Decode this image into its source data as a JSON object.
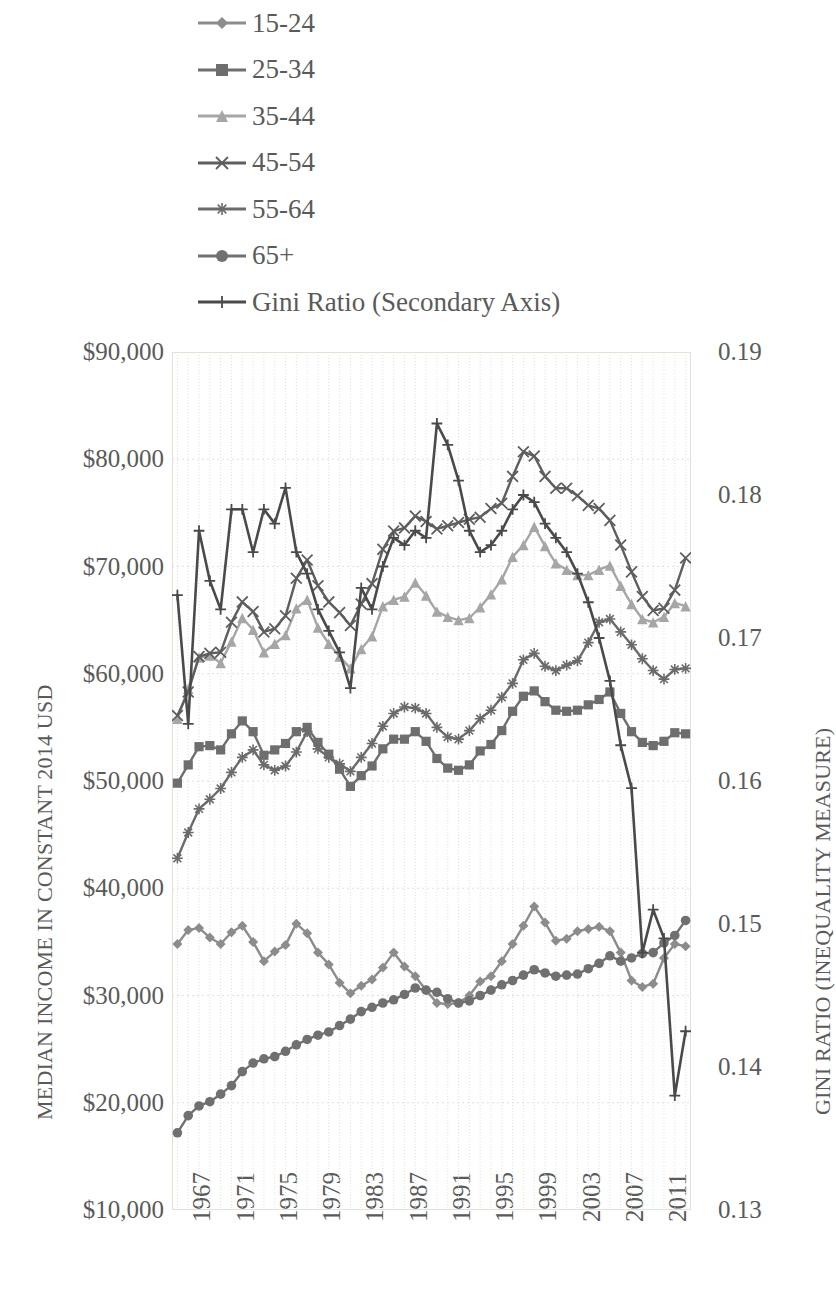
{
  "legend": {
    "position": "top",
    "items": [
      {
        "label": "15-24",
        "marker": "diamond-marker-icon",
        "color": "#8c8c8c"
      },
      {
        "label": "25-34",
        "marker": "square-marker-icon",
        "color": "#6e6e6e"
      },
      {
        "label": "35-44",
        "marker": "triangle-marker-icon",
        "color": "#a6a6a6"
      },
      {
        "label": "45-54",
        "marker": "x-marker-icon",
        "color": "#5e5e5e"
      },
      {
        "label": "55-64",
        "marker": "asterisk-marker-icon",
        "color": "#6b6b6b"
      },
      {
        "label": "65+",
        "marker": "circle-marker-icon",
        "color": "#707070"
      },
      {
        "label": "Gini Ratio (Secondary Axis)",
        "marker": "plus-marker-icon",
        "color": "#4a4a4a"
      }
    ]
  },
  "axes": {
    "y_left": {
      "title": "MEDIAN INCOME IN CONSTANT 2014 USD",
      "ticks": [
        "$90,000",
        "$80,000",
        "$70,000",
        "$60,000",
        "$50,000",
        "$40,000",
        "$30,000",
        "$20,000",
        "$10,000"
      ],
      "min": 10000,
      "max": 90000,
      "step": 10000
    },
    "y_right": {
      "title": "GINI RATIO (INEQUALITY MEASURE)",
      "ticks": [
        "0.19",
        "0.18",
        "0.17",
        "0.16",
        "0.15",
        "0.14",
        "0.13"
      ],
      "min": 0.13,
      "max": 0.19,
      "step": 0.01
    },
    "x": {
      "title": "",
      "ticks": [
        "1967",
        "1971",
        "1975",
        "1979",
        "1983",
        "1987",
        "1991",
        "1995",
        "1999",
        "2003",
        "2007",
        "2011"
      ],
      "min": 1967,
      "max": 2014
    }
  },
  "chart_data": {
    "type": "line",
    "title": "",
    "xlabel": "",
    "ylabel": "MEDIAN INCOME IN CONSTANT 2014 USD",
    "y2label": "GINI RATIO (INEQUALITY MEASURE)",
    "ylim": [
      10000,
      90000
    ],
    "y2lim": [
      0.13,
      0.19
    ],
    "xlim": [
      1967,
      2014
    ],
    "grid": true,
    "legend_position": "top",
    "x": [
      1967,
      1968,
      1969,
      1970,
      1971,
      1972,
      1973,
      1974,
      1975,
      1976,
      1977,
      1978,
      1979,
      1980,
      1981,
      1982,
      1983,
      1984,
      1985,
      1986,
      1987,
      1988,
      1989,
      1990,
      1991,
      1992,
      1993,
      1994,
      1995,
      1996,
      1997,
      1998,
      1999,
      2000,
      2001,
      2002,
      2003,
      2004,
      2005,
      2006,
      2007,
      2008,
      2009,
      2010,
      2011,
      2012,
      2013,
      2014
    ],
    "series": [
      {
        "name": "15-24",
        "marker": "diamond",
        "color": "#8c8c8c",
        "axis": "left",
        "values": [
          34800,
          36100,
          36300,
          35400,
          34800,
          35900,
          36500,
          35000,
          33200,
          34100,
          34700,
          36700,
          35800,
          34000,
          32900,
          31200,
          30200,
          30900,
          31500,
          32600,
          34000,
          32700,
          31800,
          30500,
          29300,
          29200,
          29300,
          30000,
          31300,
          31800,
          33200,
          34800,
          36500,
          38300,
          36800,
          35100,
          35300,
          36000,
          36200,
          36400,
          36000,
          34000,
          31400,
          30800,
          31100,
          33500,
          34800,
          34600
        ]
      },
      {
        "name": "25-34",
        "marker": "square",
        "color": "#6e6e6e",
        "axis": "left",
        "values": [
          49800,
          51500,
          53200,
          53300,
          52900,
          54400,
          55600,
          54600,
          52400,
          52900,
          53500,
          54600,
          55000,
          53600,
          52500,
          51100,
          49500,
          50500,
          51400,
          53000,
          53900,
          53900,
          54600,
          53700,
          52100,
          51200,
          51000,
          51500,
          52800,
          53400,
          54700,
          56500,
          57900,
          58400,
          57400,
          56600,
          56500,
          56600,
          57100,
          57600,
          58300,
          56300,
          54600,
          53600,
          53300,
          53700,
          54500,
          54400
        ]
      },
      {
        "name": "35-44",
        "marker": "triangle",
        "color": "#a6a6a6",
        "axis": "left",
        "values": [
          55800,
          58600,
          61500,
          61700,
          61000,
          63000,
          65200,
          64100,
          62000,
          62800,
          63600,
          66100,
          66900,
          64300,
          62800,
          61600,
          60500,
          62300,
          63500,
          66300,
          66900,
          67200,
          68500,
          67300,
          65800,
          65300,
          65000,
          65200,
          66200,
          67400,
          68800,
          70900,
          72000,
          73700,
          71900,
          70300,
          69700,
          69200,
          69200,
          69700,
          70100,
          68200,
          66500,
          65100,
          64800,
          65300,
          66600,
          66300
        ]
      },
      {
        "name": "45-54",
        "marker": "x",
        "color": "#5e5e5e",
        "axis": "left",
        "values": [
          56100,
          58300,
          61600,
          61900,
          62000,
          64800,
          66700,
          65800,
          63900,
          64200,
          65400,
          68900,
          70600,
          68200,
          66700,
          65700,
          64500,
          66500,
          68400,
          71600,
          73300,
          73600,
          74700,
          74200,
          73500,
          73800,
          74100,
          74400,
          74600,
          75400,
          75900,
          78400,
          80700,
          80300,
          78400,
          77300,
          77300,
          76600,
          75700,
          75400,
          74300,
          72000,
          69500,
          67200,
          65900,
          66100,
          67800,
          70800
        ]
      },
      {
        "name": "55-64",
        "marker": "asterisk",
        "color": "#6b6b6b",
        "axis": "left",
        "values": [
          42800,
          45200,
          47400,
          48300,
          49300,
          50800,
          52200,
          52900,
          51500,
          51000,
          51400,
          52700,
          54600,
          53000,
          52200,
          51600,
          50900,
          52200,
          53500,
          55100,
          56300,
          56900,
          56800,
          56300,
          55000,
          54100,
          53900,
          54700,
          55800,
          56600,
          57800,
          59100,
          61300,
          61900,
          60700,
          60300,
          60800,
          61200,
          62900,
          64800,
          65100,
          63900,
          62700,
          61400,
          60300,
          59500,
          60400,
          60500
        ]
      },
      {
        "name": "65+",
        "marker": "circle",
        "color": "#707070",
        "axis": "left",
        "values": [
          17200,
          18800,
          19700,
          20100,
          20800,
          21600,
          22900,
          23700,
          24100,
          24300,
          24800,
          25400,
          25900,
          26300,
          26600,
          27200,
          27800,
          28500,
          28900,
          29300,
          29600,
          30100,
          30700,
          30500,
          30300,
          29700,
          29300,
          29500,
          30000,
          30500,
          31000,
          31400,
          31900,
          32400,
          32100,
          31800,
          31900,
          32000,
          32500,
          33000,
          33700,
          33200,
          33500,
          33900,
          34000,
          34900,
          35600,
          37000
        ]
      },
      {
        "name": "Gini Ratio (Secondary Axis)",
        "marker": "plus",
        "color": "#4a4a4a",
        "axis": "right",
        "values": [
          0.173,
          0.164,
          0.1775,
          0.174,
          0.172,
          0.179,
          0.179,
          0.176,
          0.179,
          0.178,
          0.1805,
          0.176,
          0.1745,
          0.172,
          0.1705,
          0.169,
          0.1665,
          0.1735,
          0.172,
          0.175,
          0.177,
          0.1765,
          0.1775,
          0.177,
          0.185,
          0.1835,
          0.181,
          0.1775,
          0.176,
          0.1765,
          0.1775,
          0.179,
          0.18,
          0.1795,
          0.178,
          0.177,
          0.176,
          0.1745,
          0.1725,
          0.17,
          0.167,
          0.1625,
          0.1595,
          0.148,
          0.151,
          0.149,
          0.138,
          0.1425
        ]
      }
    ]
  }
}
